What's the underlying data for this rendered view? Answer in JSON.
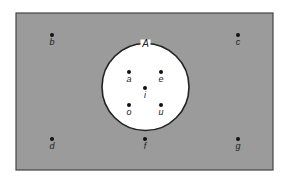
{
  "diagram": {
    "type": "venn",
    "universe": {
      "x": 16,
      "y": 13,
      "w": 257,
      "h": 157,
      "fill": "#9b9b9b",
      "stroke": "#444444"
    },
    "set": {
      "label": "A",
      "cx": 145.5,
      "cy": 87,
      "r": 43.5,
      "fill": "#ffffff",
      "stroke": "#222222"
    },
    "points": [
      {
        "label": "b",
        "x": 52,
        "y": 35,
        "in_set": false
      },
      {
        "label": "c",
        "x": 238,
        "y": 35,
        "in_set": false
      },
      {
        "label": "a",
        "x": 129,
        "y": 72,
        "in_set": true
      },
      {
        "label": "e",
        "x": 161,
        "y": 72,
        "in_set": true
      },
      {
        "label": "i",
        "x": 145,
        "y": 88,
        "in_set": true
      },
      {
        "label": "o",
        "x": 129,
        "y": 105,
        "in_set": true
      },
      {
        "label": "u",
        "x": 161,
        "y": 105,
        "in_set": true
      },
      {
        "label": "d",
        "x": 52,
        "y": 139,
        "in_set": false
      },
      {
        "label": "f",
        "x": 145,
        "y": 139,
        "in_set": false
      },
      {
        "label": "g",
        "x": 238,
        "y": 139,
        "in_set": false
      }
    ]
  }
}
